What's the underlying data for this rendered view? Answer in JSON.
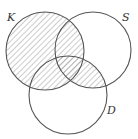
{
  "diagram": {
    "type": "venn",
    "sets": [
      {
        "label": "K",
        "cx": 45,
        "cy": 51,
        "r": 39,
        "label_x": 7,
        "label_y": 21
      },
      {
        "label": "S",
        "cx": 93,
        "cy": 50,
        "r": 38,
        "label_x": 122,
        "label_y": 21
      },
      {
        "label": "D",
        "cx": 68,
        "cy": 95,
        "r": 39,
        "label_x": 107,
        "label_y": 114
      }
    ],
    "shaded_regions": "K ∪ (S ∩ D)",
    "hatch_color": "#999999",
    "stroke_color": "#555555"
  }
}
